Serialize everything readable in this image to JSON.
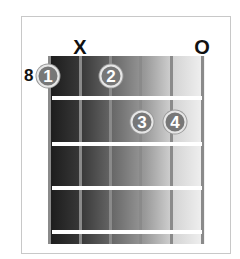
{
  "diagram": {
    "type": "guitar-chord-chart",
    "start_fret": "8",
    "string_markers": [
      {
        "string": 2,
        "label": "X",
        "meaning": "muted"
      },
      {
        "string": 6,
        "label": "O",
        "meaning": "open"
      }
    ],
    "fingers": [
      {
        "label": "1",
        "string": 1,
        "fret": 1
      },
      {
        "label": "2",
        "string": 3,
        "fret": 1
      },
      {
        "label": "3",
        "string": 4,
        "fret": 2
      },
      {
        "label": "4",
        "string": 5,
        "fret": 2
      }
    ],
    "num_strings": 6,
    "num_frets_shown": 4,
    "colors": {
      "board_dark": "#1a1a1a",
      "board_light": "#f2f2f2",
      "string": "#8a8a8a",
      "fret": "#ffffff",
      "finger": "#777777",
      "frame_border": "#c8c8c8"
    }
  }
}
